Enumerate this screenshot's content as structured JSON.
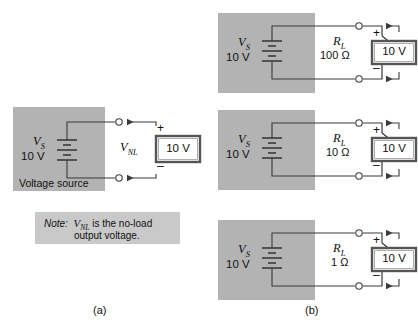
{
  "figure": {
    "captions": [
      {
        "id": "a",
        "text": "(a)"
      },
      {
        "id": "b",
        "text": "(b)"
      }
    ],
    "colors": {
      "panel_gray": "#b3b3b3",
      "note_gray": "#c9c9c9",
      "wire": "#3a3a3a",
      "meter_border": "#555555",
      "background": "#ffffff"
    }
  },
  "panel_a": {
    "panel_label": "Voltage source",
    "source": {
      "symbol": "V",
      "subscript": "S",
      "value": "10 V"
    },
    "measured_label": {
      "symbol": "V",
      "subscript": "NL"
    },
    "meter": {
      "reading": "10 V",
      "plus": "+",
      "minus": "–"
    },
    "note": {
      "lead": "Note:",
      "symbol": "V",
      "subscript": "NL",
      "line1_rest": "is the no-load",
      "line2": "output voltage."
    }
  },
  "panel_b": {
    "circuits": [
      {
        "source": {
          "symbol": "V",
          "subscript": "S",
          "value": "10 V"
        },
        "load": {
          "symbol": "R",
          "subscript": "L",
          "value": "100 Ω"
        },
        "meter": {
          "reading": "10 V",
          "plus": "+",
          "minus": "–"
        }
      },
      {
        "source": {
          "symbol": "V",
          "subscript": "S",
          "value": "10 V"
        },
        "load": {
          "symbol": "R",
          "subscript": "L",
          "value": "10 Ω"
        },
        "meter": {
          "reading": "10 V",
          "plus": "+",
          "minus": "–"
        }
      },
      {
        "source": {
          "symbol": "V",
          "subscript": "S",
          "value": "10 V"
        },
        "load": {
          "symbol": "R",
          "subscript": "L",
          "value": "1 Ω"
        },
        "meter": {
          "reading": "10 V",
          "plus": "+",
          "minus": "–"
        }
      }
    ]
  }
}
